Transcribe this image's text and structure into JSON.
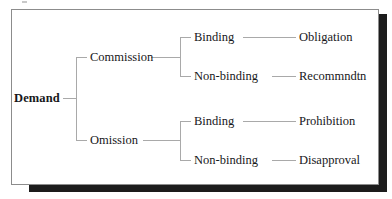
{
  "figure": {
    "type": "tree-diagram",
    "title_visible": false,
    "frame": {
      "border_color": "#8c8c8c",
      "background": "#ffffff"
    },
    "shadow_color": "#1c1c1c",
    "line_color": "#a9a9a9",
    "text_color": "#17171a"
  },
  "tree": {
    "root": {
      "label": "Demand",
      "bold": true
    },
    "level2": [
      {
        "label": "Commission"
      },
      {
        "label": "Omission"
      }
    ],
    "level3": [
      {
        "label": "Binding"
      },
      {
        "label": "Non-binding"
      },
      {
        "label": "Binding"
      },
      {
        "label": "Non-binding"
      }
    ],
    "leaves": [
      {
        "label": "Obligation"
      },
      {
        "label": "Recommndtn"
      },
      {
        "label": "Prohibition"
      },
      {
        "label": "Disapproval"
      }
    ],
    "paths": [
      {
        "root": "Demand",
        "branch": "Commission",
        "modality": "Binding",
        "outcome": "Obligation"
      },
      {
        "root": "Demand",
        "branch": "Commission",
        "modality": "Non-binding",
        "outcome": "Recommndtn"
      },
      {
        "root": "Demand",
        "branch": "Omission",
        "modality": "Binding",
        "outcome": "Prohibition"
      },
      {
        "root": "Demand",
        "branch": "Omission",
        "modality": "Non-binding",
        "outcome": "Disapproval"
      }
    ]
  }
}
